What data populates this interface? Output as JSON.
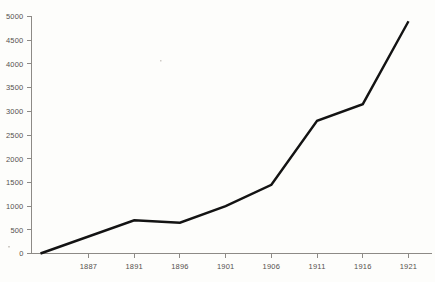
{
  "chart_data": {
    "type": "line",
    "title": "",
    "subtitle": "",
    "xlabel": "",
    "ylabel": "",
    "categories": [
      "1887",
      "1891",
      "1896",
      "1901",
      "1906",
      "1911",
      "1916",
      "1921"
    ],
    "x": [
      1887,
      1891,
      1896,
      1901,
      1906,
      1911,
      1916,
      1921
    ],
    "values": [
      50,
      700,
      650,
      1000,
      1450,
      2800,
      3150,
      4900
    ],
    "series": [
      {
        "name": "",
        "values": [
          50,
          700,
          650,
          1000,
          1450,
          2800,
          3150,
          4900
        ]
      }
    ],
    "xlim": [
      1887,
      1921
    ],
    "ylim": [
      0,
      5000
    ],
    "y_ticks": [
      0,
      500,
      1000,
      1500,
      2000,
      2500,
      3000,
      3500,
      4000,
      4500,
      5000
    ],
    "y_tick_labels": [
      "0",
      "500",
      "1000",
      "1500",
      "2000",
      "2500",
      "3000",
      "3500",
      "4000",
      "4500",
      "5000"
    ],
    "x_ticks": [
      1887,
      1891,
      1896,
      1901,
      1906,
      1911,
      1916,
      1921
    ],
    "x_tick_labels": [
      "1887",
      "1891",
      "1896",
      "1901",
      "1906",
      "1911",
      "1916",
      "1921"
    ],
    "grid": false,
    "legend": false,
    "legend_position": "none",
    "line_color": "#131313",
    "axis_color": "#8d8a86",
    "label_color": "#55514e",
    "background_color": "#fdfdfb"
  },
  "axis": {
    "y_labels": [
      "5000",
      "4500",
      "4000",
      "3500",
      "3000",
      "2500",
      "2000",
      "1500",
      "1000",
      "500",
      "0"
    ],
    "x_labels": [
      "1887",
      "1891",
      "1896",
      "1901",
      "1906",
      "1911",
      "1916",
      "1921"
    ]
  }
}
